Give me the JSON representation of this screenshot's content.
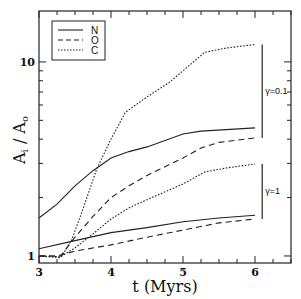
{
  "chart_data": {
    "type": "line",
    "title": "",
    "xlabel": "t (Myrs)",
    "ylabel": "A_i / A_o",
    "xscale": "linear",
    "yscale": "log",
    "xlim": [
      3.0,
      6.5
    ],
    "ylim": [
      0.92,
      18.3
    ],
    "xticks": [
      3,
      4,
      5,
      6
    ],
    "xtick_labels": [
      "3",
      "4",
      "5",
      "6"
    ],
    "x_minor_step": 0.25,
    "yticks": [
      1,
      10
    ],
    "ytick_labels": [
      "1",
      "10"
    ],
    "grid": false,
    "legend": {
      "position": "upper left",
      "entries": [
        {
          "label": "N",
          "style": "solid"
        },
        {
          "label": "O",
          "style": "dashed"
        },
        {
          "label": "C",
          "style": "dotted"
        }
      ]
    },
    "annotations": [
      {
        "text": "γ=0.1",
        "bracket_y": [
          4.06,
          12.3
        ],
        "x": 6.1
      },
      {
        "text": "γ=1",
        "bracket_y": [
          1.55,
          2.98
        ],
        "x": 6.1
      }
    ],
    "series": [
      {
        "name": "N",
        "group": "γ=0.1",
        "style": "solid",
        "x": [
          3.0,
          3.25,
          3.5,
          3.75,
          4.0,
          4.25,
          4.5,
          5.0,
          5.25,
          6.0
        ],
        "y": [
          1.57,
          1.85,
          2.3,
          2.75,
          3.2,
          3.45,
          3.65,
          4.25,
          4.4,
          4.57
        ]
      },
      {
        "name": "O",
        "group": "γ=0.1",
        "style": "dashed",
        "x": [
          3.0,
          3.3,
          3.5,
          3.75,
          4.0,
          4.25,
          4.5,
          5.0,
          5.25,
          5.5,
          6.0
        ],
        "y": [
          1.0,
          1.0,
          1.25,
          1.6,
          2.0,
          2.3,
          2.6,
          3.2,
          3.6,
          3.85,
          4.06
        ]
      },
      {
        "name": "C",
        "group": "γ=0.1",
        "style": "dotted",
        "x": [
          3.0,
          3.3,
          3.45,
          3.6,
          3.8,
          4.0,
          4.2,
          4.5,
          4.8,
          5.0,
          5.3,
          5.6,
          6.0
        ],
        "y": [
          1.0,
          0.98,
          1.2,
          1.7,
          2.8,
          4.0,
          5.5,
          6.6,
          7.8,
          9.0,
          11.2,
          11.8,
          12.3
        ]
      },
      {
        "name": "N",
        "group": "γ=1",
        "style": "solid",
        "x": [
          3.0,
          3.5,
          4.0,
          4.5,
          5.0,
          5.5,
          6.0
        ],
        "y": [
          1.09,
          1.2,
          1.32,
          1.4,
          1.5,
          1.57,
          1.62
        ]
      },
      {
        "name": "O",
        "group": "γ=1",
        "style": "dashed",
        "x": [
          3.0,
          3.25,
          3.5,
          4.0,
          4.5,
          5.0,
          5.5,
          6.0
        ],
        "y": [
          1.0,
          1.0,
          1.06,
          1.14,
          1.25,
          1.36,
          1.48,
          1.55
        ]
      },
      {
        "name": "C",
        "group": "γ=1",
        "style": "dotted",
        "x": [
          3.0,
          3.3,
          3.5,
          3.75,
          4.0,
          4.25,
          4.5,
          5.0,
          5.3,
          5.6,
          6.0
        ],
        "y": [
          1.0,
          0.99,
          1.1,
          1.3,
          1.55,
          1.77,
          1.95,
          2.35,
          2.71,
          2.84,
          2.98
        ]
      }
    ]
  }
}
